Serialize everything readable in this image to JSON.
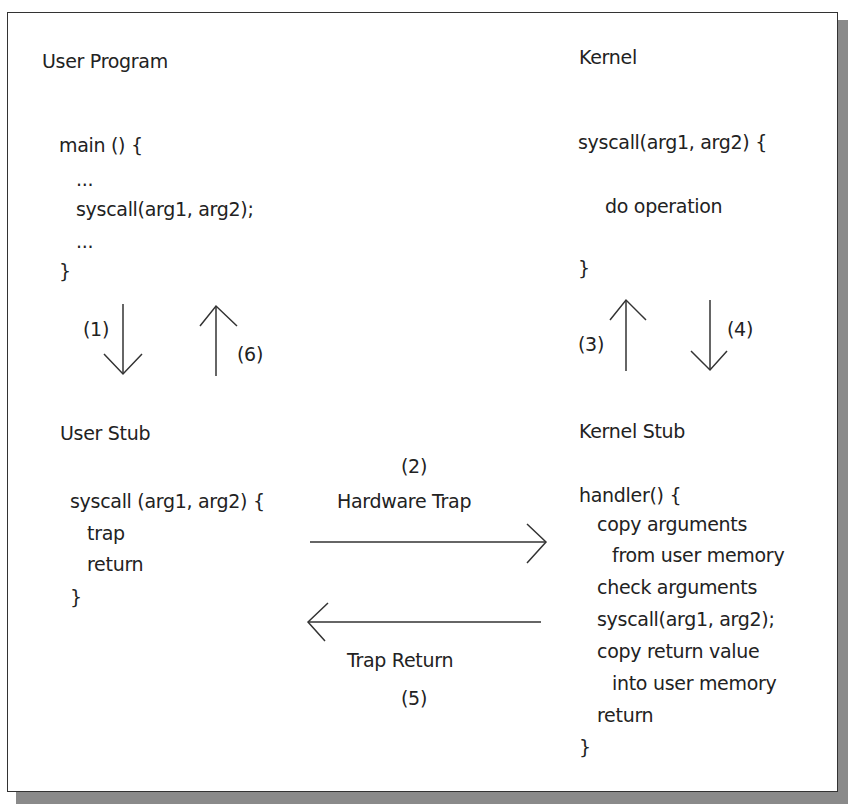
{
  "user_program": {
    "title": "User Program",
    "code": [
      "main () {",
      "...",
      "syscall(arg1, arg2);",
      "...",
      "}"
    ]
  },
  "kernel": {
    "title": "Kernel",
    "code": [
      "syscall(arg1, arg2) {",
      "do operation",
      "}"
    ]
  },
  "user_stub": {
    "title": "User Stub",
    "code": [
      "syscall (arg1, arg2) {",
      "trap",
      "return",
      "}"
    ]
  },
  "kernel_stub": {
    "title": "Kernel Stub",
    "code": [
      "handler() {",
      "copy arguments",
      "from user memory",
      "check arguments",
      "syscall(arg1, arg2);",
      "copy return value",
      "into user memory",
      "return",
      "}"
    ]
  },
  "arrows": {
    "step1": "(1)",
    "step2": "(2)",
    "step2_label": "Hardware Trap",
    "step3": "(3)",
    "step4": "(4)",
    "step5": "(5)",
    "step5_label": "Trap Return",
    "step6": "(6)"
  }
}
